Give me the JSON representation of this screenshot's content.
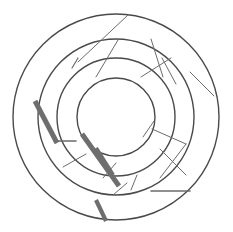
{
  "figure": {
    "background_color": "#ffffff",
    "width": 233,
    "height": 232,
    "center_x": 116,
    "center_y": 117
  },
  "chart_data": {
    "type": "scatter",
    "subtitle": "",
    "xlabel": "",
    "ylabel": "",
    "grid": false,
    "legend_position": "none",
    "xlim": [
      0,
      233
    ],
    "ylim": [
      0,
      232
    ],
    "center": [
      116,
      117
    ],
    "ring_color": "#4a4a4a",
    "spoke_color": "#6b6b6b",
    "thick_color": "#6e6e6e",
    "rings": [
      {
        "name": "ring-outer",
        "radius": 103,
        "stroke_width": 1.4,
        "color": "#4a4a4a"
      },
      {
        "name": "ring-second",
        "radius": 78,
        "stroke_width": 1.4,
        "color": "#4a4a4a"
      },
      {
        "name": "ring-third",
        "radius": 59,
        "stroke_width": 1.4,
        "color": "#4a4a4a"
      },
      {
        "name": "ring-inner",
        "radius": 39,
        "stroke_width": 1.4,
        "color": "#4a4a4a"
      }
    ],
    "spokes": [
      {
        "name": "spoke-top-left-oblique",
        "x1": 78,
        "y1": 62,
        "x2": 128,
        "y2": 15,
        "width": 1.0
      },
      {
        "name": "spoke-top-left-short",
        "x1": 72,
        "y1": 68,
        "x2": 78,
        "y2": 58,
        "width": 1.2
      },
      {
        "name": "spoke-top-left-inner",
        "x1": 96,
        "y1": 77,
        "x2": 118,
        "y2": 40,
        "width": 1.0
      },
      {
        "name": "spoke-top-right-upper",
        "x1": 151,
        "y1": 39,
        "x2": 163,
        "y2": 77,
        "width": 1.0
      },
      {
        "name": "spoke-top-right-cross-a",
        "x1": 141,
        "y1": 77,
        "x2": 171,
        "y2": 58,
        "width": 1.0
      },
      {
        "name": "spoke-top-right-cross-b",
        "x1": 162,
        "y1": 58,
        "x2": 176,
        "y2": 84,
        "width": 1.0
      },
      {
        "name": "spoke-right-outer",
        "x1": 190,
        "y1": 72,
        "x2": 214,
        "y2": 96,
        "width": 1.0
      },
      {
        "name": "spoke-right-mid",
        "x1": 152,
        "y1": 129,
        "x2": 186,
        "y2": 144,
        "width": 1.0
      },
      {
        "name": "spoke-right-lower-a",
        "x1": 160,
        "y1": 149,
        "x2": 186,
        "y2": 175,
        "width": 1.0
      },
      {
        "name": "spoke-right-lower-b",
        "x1": 186,
        "y1": 144,
        "x2": 160,
        "y2": 178,
        "width": 1.0
      },
      {
        "name": "spoke-right-flat",
        "x1": 151,
        "y1": 191,
        "x2": 190,
        "y2": 191,
        "width": 1.6
      },
      {
        "name": "spoke-right-inner-short",
        "x1": 143,
        "y1": 137,
        "x2": 154,
        "y2": 121,
        "width": 1.0
      },
      {
        "name": "spoke-lower-left-a",
        "x1": 63,
        "y1": 167,
        "x2": 86,
        "y2": 154,
        "width": 1.0
      },
      {
        "name": "spoke-lower-left-b",
        "x1": 103,
        "y1": 178,
        "x2": 116,
        "y2": 163,
        "width": 1.0
      },
      {
        "name": "spoke-left-flat",
        "x1": 54,
        "y1": 141,
        "x2": 76,
        "y2": 141,
        "width": 1.6
      },
      {
        "name": "spoke-bottom-short",
        "x1": 131,
        "y1": 190,
        "x2": 137,
        "y2": 175,
        "width": 1.0
      },
      {
        "name": "spoke-bottom-mid",
        "x1": 113,
        "y1": 195,
        "x2": 127,
        "y2": 183,
        "width": 1.0
      }
    ],
    "thick_strokes": [
      {
        "name": "thick-stroke-upper-left",
        "x1": 35,
        "y1": 101,
        "x2": 57,
        "y2": 143,
        "width": 5.0
      },
      {
        "name": "thick-stroke-center-long",
        "x1": 82,
        "y1": 134,
        "x2": 119,
        "y2": 186,
        "width": 5.0
      },
      {
        "name": "thick-stroke-center-short",
        "x1": 96,
        "y1": 148,
        "x2": 113,
        "y2": 175,
        "width": 4.2
      },
      {
        "name": "thick-stroke-bottom",
        "x1": 96,
        "y1": 200,
        "x2": 106,
        "y2": 221,
        "width": 4.2
      }
    ]
  }
}
